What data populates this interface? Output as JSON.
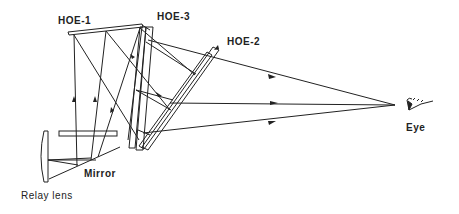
{
  "diagram": {
    "type": "optical-layout",
    "labels": {
      "hoe1": "HOE-1",
      "hoe3": "HOE-3",
      "hoe2": "HOE-2",
      "mirror": "Mirror",
      "relay_lens": "Relay lens",
      "eye": "Eye"
    },
    "colors": {
      "line": "#222222",
      "background": "#ffffff"
    }
  }
}
